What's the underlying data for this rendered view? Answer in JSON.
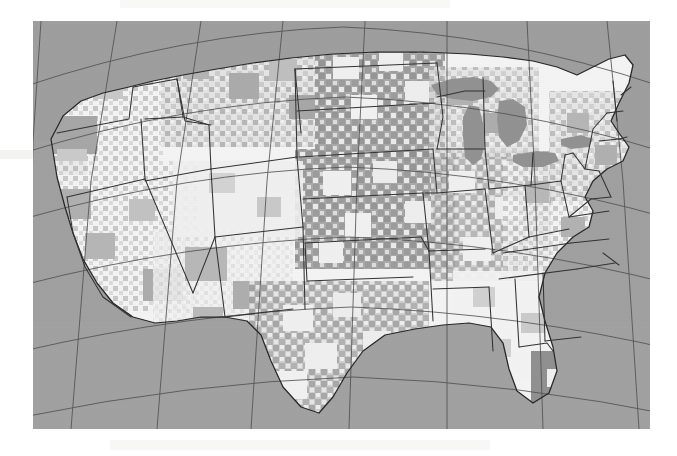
{
  "document": {
    "type": "scanned-figure",
    "page_background": "#ffffff"
  },
  "figure": {
    "name": "us-county-choropleth-map",
    "projection": "Lambert Conformal Conic",
    "bounds": {
      "x": 33,
      "y": 21,
      "width": 617,
      "height": 408
    },
    "graticule": {
      "visible": true,
      "meridian_count": 9,
      "parallel_count": 6,
      "line_color": "#4a4a4a"
    }
  },
  "colors": {
    "background_outside": "#9a9a9a",
    "ocean": "#9d9d9d",
    "canada": "#9a9a9a",
    "mexico": "#a0a0a0",
    "great_lakes": "#8f8f8f",
    "class_low": "#f4f4f4",
    "class_mid_low": "#dcdcdc",
    "class_mid": "#c2c2c2",
    "class_mid_high": "#a6a6a6",
    "class_high": "#8c8c8c",
    "state_border": "#2b2b2b",
    "coastline": "#1f1f1f",
    "graticule": "#4a4a4a",
    "page": "#ffffff"
  },
  "chart_data": {
    "type": "heatmap",
    "title": "",
    "subtitle": "",
    "xlabel": "",
    "ylabel": "",
    "legend": [],
    "classes": [
      {
        "label": "lowest",
        "fill": "#f4f4f4"
      },
      {
        "label": "low",
        "fill": "#dcdcdc"
      },
      {
        "label": "medium",
        "fill": "#c2c2c2"
      },
      {
        "label": "high",
        "fill": "#a6a6a6"
      },
      {
        "label": "highest",
        "fill": "#8c8c8c"
      }
    ],
    "regions": [
      {
        "name": "Pacific Northwest",
        "dominant_class": "lowest"
      },
      {
        "name": "Northern Plains",
        "dominant_class": "high"
      },
      {
        "name": "Great Plains",
        "dominant_class": "high"
      },
      {
        "name": "Southwest",
        "dominant_class": "low"
      },
      {
        "name": "Texas",
        "dominant_class": "medium"
      },
      {
        "name": "Midwest",
        "dominant_class": "medium"
      },
      {
        "name": "Southeast",
        "dominant_class": "lowest"
      },
      {
        "name": "Florida",
        "dominant_class": "highest"
      },
      {
        "name": "Northeast",
        "dominant_class": "low"
      }
    ]
  }
}
